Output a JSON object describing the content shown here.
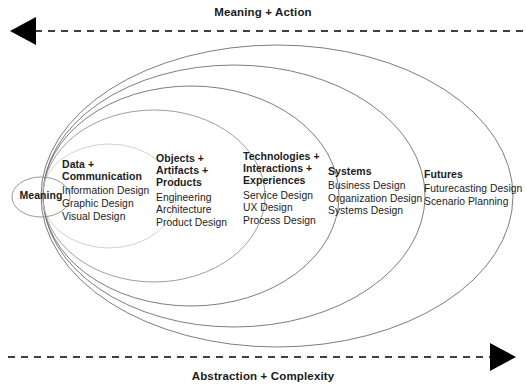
{
  "diagram": {
    "title_top": "Meaning + Action",
    "title_bottom": "Abstraction + Complexity",
    "core_label": "Meaning",
    "colors": {
      "arrow": "#000000",
      "text": "#1c1c1c",
      "ellipse_stroke": "#6e6e6e",
      "ellipse_stroke_light": "#c9c9c9",
      "background": "#ffffff"
    },
    "clusters": [
      {
        "heading": "Data +\nCommunication",
        "items": [
          "Information Design",
          "Graphic Design",
          "Visual Design"
        ]
      },
      {
        "heading": "Objects +\nArtifacts +\nProducts",
        "items": [
          "Engineering",
          "Architecture",
          "Product Design"
        ]
      },
      {
        "heading": "Technologies +\nInteractions +\nExperiences",
        "items": [
          "Service Design",
          "UX Design",
          "Process Design"
        ]
      },
      {
        "heading": "Systems",
        "items": [
          "Business Design",
          "Organization Design",
          "Systems Design"
        ]
      },
      {
        "heading": "Futures",
        "items": [
          "Futurecasting Design",
          "Scenario Planning"
        ]
      }
    ]
  }
}
